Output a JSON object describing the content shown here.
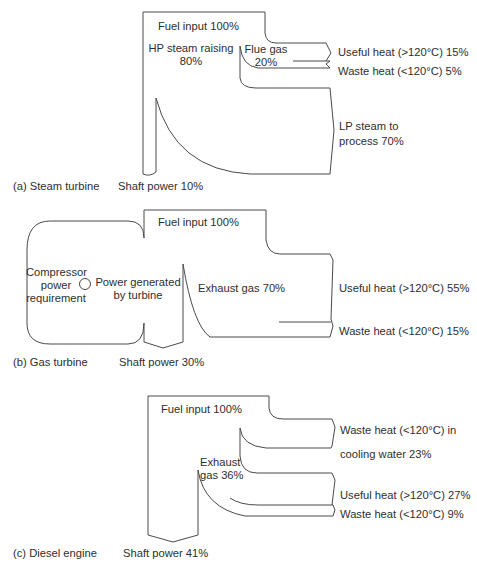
{
  "figure": {
    "panels": [
      {
        "id": "a",
        "caption": "(a) Steam turbine",
        "fuel_input": "Fuel input 100%",
        "hp_steam": {
          "line1": "HP steam raising",
          "line2": "80%"
        },
        "flue_gas": {
          "line1": "Flue gas",
          "line2": "20%"
        },
        "useful_heat": "Useful heat (>120°C) 15%",
        "waste_heat": "Waste heat (<120°C) 5%",
        "lp_steam": {
          "line1": "LP steam to",
          "line2": "process 70%"
        },
        "shaft_power": "Shaft power 10%"
      },
      {
        "id": "b",
        "caption": "(b) Gas turbine",
        "fuel_input": "Fuel input 100%",
        "compressor": {
          "line1": "Compressor",
          "line2": "power",
          "line3": "requirement"
        },
        "power_generated": {
          "line1": "Power generated",
          "line2": "by turbine"
        },
        "exhaust_gas": "Exhaust gas 70%",
        "useful_heat": "Useful heat (>120°C) 55%",
        "waste_heat": "Waste heat (<120°C) 15%",
        "shaft_power": "Shaft power 30%"
      },
      {
        "id": "c",
        "caption": "(c) Diesel engine",
        "fuel_input": "Fuel input 100%",
        "cooling_water": {
          "line1": "Waste heat (<120°C) in",
          "line2": "cooling water 23%"
        },
        "exhaust_gas": {
          "line1": "Exhaust",
          "line2": "gas 36%"
        },
        "useful_heat": "Useful heat (>120°C) 27%",
        "waste_heat": "Waste heat (<120°C) 9%",
        "shaft_power": "Shaft power 41%"
      }
    ]
  },
  "colors": {
    "stroke": "#4a4a4a",
    "text": "#2e2e2e",
    "background": "#ffffff"
  }
}
